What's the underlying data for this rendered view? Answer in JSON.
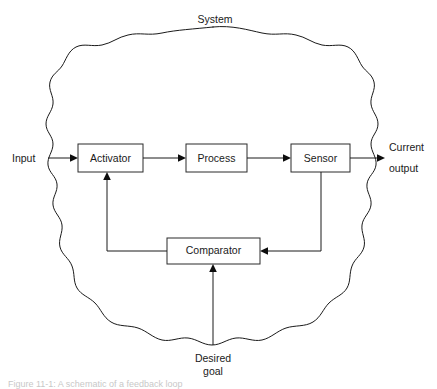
{
  "figure": {
    "system_label": "System",
    "input_label": "Input",
    "output_label_line1": "Current",
    "output_label_line2": "output",
    "goal_label_line1": "Desired",
    "goal_label_line2": "goal",
    "caption": "Figure 11-1: A schematic of a feedback loop",
    "colors": {
      "background": "#ffffff",
      "line": "#1a1a1a",
      "box_border": "#2b2b2b",
      "text": "#1a1a1a",
      "caption": "#9a9a9a"
    }
  },
  "boxes": [
    {
      "id": "activator",
      "label": "Activator"
    },
    {
      "id": "process",
      "label": "Process"
    },
    {
      "id": "sensor",
      "label": "Sensor"
    },
    {
      "id": "comparator",
      "label": "Comparator"
    }
  ]
}
